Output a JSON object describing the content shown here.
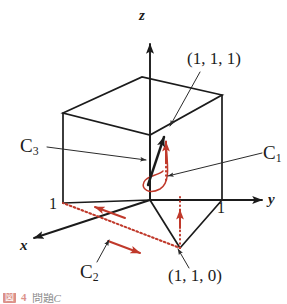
{
  "figure": {
    "type": "geometry-diagram",
    "colors": {
      "stroke": "#1b1b1b",
      "accent_red": "#c0392b",
      "leader": "#3a3a3a",
      "background": "#ffffff"
    },
    "axes": [
      {
        "name": "z-axis",
        "label": "z"
      },
      {
        "name": "y-axis",
        "label": "y"
      },
      {
        "name": "x-axis",
        "label": "x"
      }
    ],
    "ticks": [
      {
        "name": "x-axis-tick",
        "label": "1"
      },
      {
        "name": "y-axis-tick",
        "label": "1"
      }
    ],
    "points": [
      {
        "name": "point-111",
        "label": "(1, 1, 1)"
      },
      {
        "name": "point-110",
        "label": "(1, 1, 0)"
      }
    ],
    "curves": [
      {
        "name": "curve-c1",
        "label": "C",
        "subscript": "1"
      },
      {
        "name": "curve-c2",
        "label": "C",
        "subscript": "2"
      },
      {
        "name": "curve-c3",
        "label": "C",
        "subscript": "3"
      }
    ]
  },
  "caption": {
    "badge": "図",
    "number": "4",
    "text": "問題",
    "text_italic": "C"
  }
}
